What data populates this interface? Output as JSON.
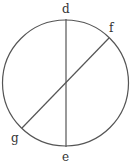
{
  "diagram": {
    "type": "circle-with-chords",
    "stroke_color": "#555555",
    "circle": {
      "cx": 65.5,
      "cy": 83,
      "r": 63
    },
    "chords": [
      {
        "name": "de",
        "from": "d",
        "to": "e"
      },
      {
        "name": "fg",
        "from": "f",
        "to": "g"
      }
    ],
    "points": {
      "d": {
        "label": "d",
        "x": 66,
        "y": 19
      },
      "e": {
        "label": "e",
        "x": 66,
        "y": 147
      },
      "f": {
        "label": "f",
        "x": 109,
        "y": 38
      },
      "g": {
        "label": "g",
        "x": 22,
        "y": 128
      }
    }
  }
}
